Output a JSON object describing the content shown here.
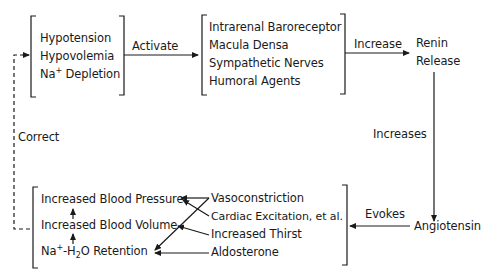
{
  "diagram": {
    "title": "",
    "nodes": {
      "conditions": {
        "items": [
          "Hypotension",
          "Hypovolemia",
          "Na+ Depletion"
        ],
        "na_prefix": "Na",
        "na_sup": "+",
        "na_suffix": " Depletion"
      },
      "receptors": {
        "items": [
          "Intrarenal Baroreceptor",
          "Macula Densa",
          "Sympathetic Nerves",
          "Humoral Agents"
        ]
      },
      "renin": {
        "line1": "Renin",
        "line2": "Release"
      },
      "angiotensin": {
        "label": "Angiotensin"
      },
      "effects": {
        "items": [
          "Vasoconstriction",
          "Cardiac Excitation, et al.",
          "Increased Thirst",
          "Aldosterone"
        ]
      },
      "outcomes": {
        "items": [
          "Increased Blood Pressure",
          "Increased Blood Volume",
          "Na+-H2O Retention"
        ],
        "retention_parts": {
          "na": "Na",
          "plus": "+",
          "dash_h": "-H",
          "two": "2",
          "rest": "O Retention"
        }
      }
    },
    "edges": {
      "activate": "Activate",
      "increase": "Increase",
      "increases": "Increases",
      "evokes": "Evokes",
      "correct": "Correct"
    },
    "connections": [
      {
        "from": "conditions",
        "to": "receptors",
        "label": "Activate"
      },
      {
        "from": "receptors",
        "to": "renin",
        "label": "Increase"
      },
      {
        "from": "renin",
        "to": "angiotensin",
        "label": "Increases"
      },
      {
        "from": "angiotensin",
        "to": "effects",
        "label": "Evokes"
      },
      {
        "from": "Vasoconstriction",
        "to": "Increased Blood Pressure"
      },
      {
        "from": "Vasoconstriction",
        "to": "Na+-H2O Retention"
      },
      {
        "from": "Cardiac Excitation, et al.",
        "to": "Increased Blood Pressure"
      },
      {
        "from": "Increased Thirst",
        "to": "Increased Blood Volume"
      },
      {
        "from": "Aldosterone",
        "to": "Na+-H2O Retention"
      },
      {
        "from": "Na+-H2O Retention",
        "to": "Increased Blood Volume"
      },
      {
        "from": "Increased Blood Volume",
        "to": "Increased Blood Pressure"
      },
      {
        "from": "outcomes",
        "to": "conditions",
        "label": "Correct",
        "style": "dashed"
      }
    ]
  }
}
